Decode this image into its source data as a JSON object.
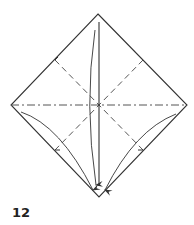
{
  "diagram": {
    "step_number": "12",
    "colors": {
      "line": "#333333",
      "crease": "#555555",
      "background": "#ffffff"
    },
    "square": {
      "top": [
        98,
        14
      ],
      "right": [
        187,
        105
      ],
      "bottom": [
        99,
        197
      ],
      "left": [
        11,
        105
      ]
    },
    "creases": [
      {
        "type": "valley-dashed",
        "from": [
          55,
          60
        ],
        "to": [
          143,
          150
        ]
      },
      {
        "type": "valley-dashed",
        "from": [
          143,
          60
        ],
        "to": [
          55,
          150
        ]
      },
      {
        "type": "mountain-dash-dot",
        "from": [
          11,
          105
        ],
        "to": [
          187,
          105
        ]
      }
    ],
    "arrows": [
      {
        "name": "top-fold-arrow",
        "direction": "down",
        "target": "bottom-corner"
      },
      {
        "name": "left-fold-arrow",
        "direction": "down-right",
        "target": "bottom-corner"
      },
      {
        "name": "right-fold-arrow",
        "direction": "down-left",
        "target": "bottom-corner"
      }
    ]
  }
}
